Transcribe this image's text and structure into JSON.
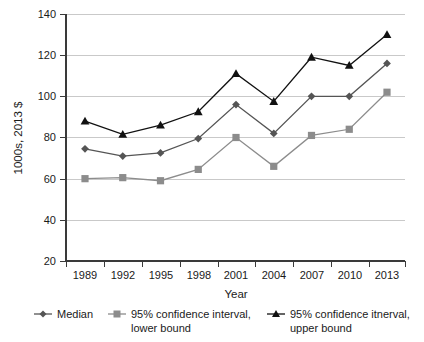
{
  "chart_data": {
    "type": "line",
    "title": "",
    "xlabel": "Year",
    "ylabel": "1000s, 2013 $",
    "categories": [
      "1989",
      "1992",
      "1995",
      "1998",
      "2001",
      "2004",
      "2007",
      "2010",
      "2013"
    ],
    "ylim": [
      20,
      140
    ],
    "yticks": [
      20,
      40,
      60,
      80,
      100,
      120,
      140
    ],
    "grid": "horizontal",
    "legend_position": "bottom",
    "series": [
      {
        "name": "Median",
        "marker": "diamond",
        "color": "#555555",
        "values": [
          74.5,
          71,
          72.5,
          79.5,
          96,
          82,
          100,
          100,
          116
        ]
      },
      {
        "name": "95% confidence interval, lower bound",
        "marker": "square",
        "color": "#8c8c8c",
        "values": [
          60,
          60.5,
          59,
          64.5,
          80,
          66,
          81,
          84,
          102
        ]
      },
      {
        "name": "95% confidence itnerval, upper bound",
        "marker": "triangle",
        "color": "#111111",
        "values": [
          88,
          81.5,
          86,
          92.5,
          111,
          97.5,
          119,
          115,
          130
        ]
      }
    ]
  },
  "legend": {
    "items": [
      {
        "label": "Median"
      },
      {
        "label_line1": "95% confidence interval,",
        "label_line2": "lower bound"
      },
      {
        "label_line1": "95% confidence itnerval,",
        "label_line2": "upper bound"
      }
    ]
  },
  "axes": {
    "y_title": "1000s, 2013 $",
    "x_title": "Year"
  }
}
